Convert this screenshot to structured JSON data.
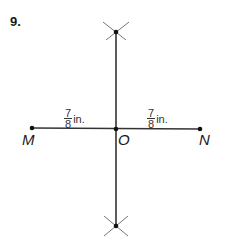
{
  "problem_number": "9.",
  "points": {
    "M": "M",
    "O": "O",
    "N": "N"
  },
  "labels": {
    "left_segment": {
      "numerator": "7",
      "denominator": "8",
      "unit": "in."
    },
    "right_segment": {
      "numerator": "7",
      "denominator": "8",
      "unit": "in."
    }
  },
  "colors": {
    "line": "#333333",
    "arc": "#666666",
    "point": "#111111"
  }
}
